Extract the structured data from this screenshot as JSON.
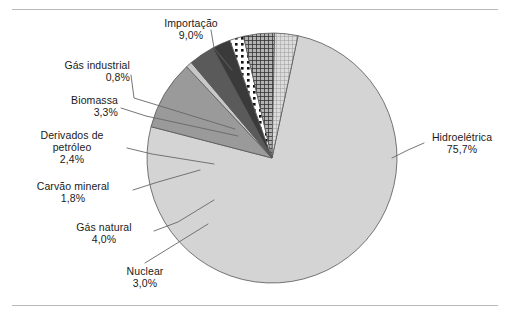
{
  "chart_data": {
    "type": "pie",
    "title": "",
    "subtitle": "",
    "xlabel": "",
    "ylabel": "",
    "legend_position": "callout-labels",
    "grid": false,
    "unit": "%",
    "decimal_separator": ",",
    "total": 100.0,
    "categories": [
      "Hidroelétrica",
      "Importação",
      "Gás industrial",
      "Biomassa",
      "Derivados de petróleo",
      "Carvão mineral",
      "Gás natural",
      "Nuclear"
    ],
    "values": [
      75.7,
      9.0,
      0.8,
      3.3,
      2.4,
      1.8,
      4.0,
      3.0
    ],
    "labels": [
      "75,7%",
      "9,0%",
      "0,8%",
      "3,3%",
      "2,4%",
      "1,8%",
      "4,0%",
      "3,0%"
    ],
    "slices": [
      {
        "name": "Hidroelétrica",
        "value": 75.7,
        "label": "75,7%",
        "fill": "#d4d4d4",
        "pattern": "solid"
      },
      {
        "name": "Importação",
        "value": 9.0,
        "label": "9,0%",
        "fill": "#9a9a9a",
        "pattern": "solid"
      },
      {
        "name": "Gás industrial",
        "value": 0.8,
        "label": "0,8%",
        "fill": "#c8c8c8",
        "pattern": "solid"
      },
      {
        "name": "Biomassa",
        "value": 3.3,
        "label": "3,3%",
        "fill": "#5a5a5a",
        "pattern": "solid"
      },
      {
        "name": "Derivados de petróleo",
        "value": 2.4,
        "label": "2,4%",
        "fill": "#3a3a3a",
        "pattern": "solid"
      },
      {
        "name": "Carvão mineral",
        "value": 1.8,
        "label": "1,8%",
        "fill": "#ffffff",
        "pattern": "dots-black-on-white"
      },
      {
        "name": "Gás natural",
        "value": 4.0,
        "label": "4,0%",
        "fill": "#101010",
        "pattern": "dots-white-on-black"
      },
      {
        "name": "Nuclear",
        "value": 3.0,
        "label": "3,0%",
        "fill": "#bdbdbd",
        "pattern": "fine-grid"
      }
    ]
  },
  "callouts": {
    "importacao": {
      "name": "Importação",
      "pct": "9,0%"
    },
    "gas_industrial": {
      "name": "Gás industrial",
      "pct": "0,8%"
    },
    "biomassa": {
      "name": "Biomassa",
      "pct": "3,3%"
    },
    "derivados": {
      "name": "Derivados de",
      "name2": "petróleo",
      "pct": "2,4%"
    },
    "carvao": {
      "name": "Carvão mineral",
      "pct": "1,8%"
    },
    "gas_natural": {
      "name": "Gás natural",
      "pct": "4,0%"
    },
    "nuclear": {
      "name": "Nuclear",
      "pct": "3,0%"
    },
    "hidroeletrica": {
      "name": "Hidroelétrica",
      "pct": "75,7%"
    }
  },
  "colors": {
    "rule": "#b9b9b9",
    "outline": "#555555",
    "leader": "#666666",
    "text": "#1a1a1a",
    "page_bg": "#ffffff"
  }
}
